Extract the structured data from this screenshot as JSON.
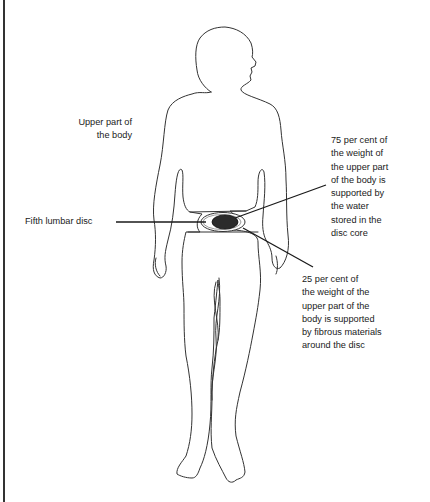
{
  "diagram": {
    "labels": {
      "upper_body": "Upper part of\nthe body",
      "fifth_lumbar_disc": "Fifth lumbar disc",
      "note_75": "75 per cent of\nthe weight of\nthe upper part\nof the body is\nsupported by\nthe water\nstored in the\ndisc core",
      "note_25": "25 per cent of\nthe weight of the\nupper part of the\nbody is supported\nby fibrous materials\naround the disc"
    },
    "values": {
      "water_core_percent": 75,
      "fibrous_percent": 25
    },
    "colors": {
      "outline": "#333333",
      "disc_core": "#2b2b2b",
      "leader_line": "#1a1a1a"
    }
  }
}
